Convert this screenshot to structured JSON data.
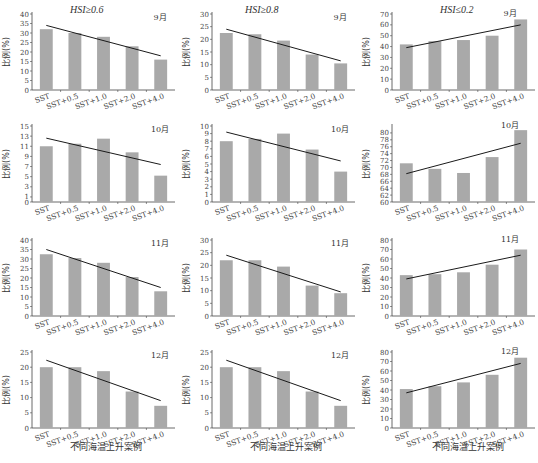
{
  "column_titles": [
    "HSI≥0.6",
    "HSI≥0.8",
    "HSI≤0.2"
  ],
  "x_axis_label": "不同海温上升案例",
  "y_axis_label": "比例(%)",
  "colors": {
    "bar": "#a9a9a9",
    "trend": "#1a1a1a",
    "axis": "#444444"
  },
  "chart_data": [
    {
      "type": "bar",
      "title": "HSI≥0.6",
      "month": "9月",
      "categories": [
        "SST",
        "SST+0.5",
        "SST+1.0",
        "SST+2.0",
        "SST+4.0"
      ],
      "values": [
        32,
        30,
        28,
        23,
        16
      ],
      "trend": [
        34,
        18
      ],
      "ylabel": "比例(%)",
      "ylim": [
        0,
        40
      ],
      "yticks": [
        0,
        5,
        10,
        15,
        20,
        25,
        30,
        35,
        40
      ]
    },
    {
      "type": "bar",
      "title": "HSI≥0.8",
      "month": "9月",
      "categories": [
        "SST",
        "SST+0.5",
        "SST+1.0",
        "SST+2.0",
        "SST+4.0"
      ],
      "values": [
        22.5,
        22,
        19.5,
        14,
        10.5
      ],
      "trend": [
        24,
        11.5
      ],
      "ylabel": "比例(%)",
      "ylim": [
        0,
        30
      ],
      "yticks": [
        0,
        5,
        10,
        15,
        20,
        25,
        30
      ]
    },
    {
      "type": "bar",
      "title": "HSI≤0.2",
      "month": "9月",
      "categories": [
        "SST",
        "SST+0.5",
        "SST+1.0",
        "SST+2.0",
        "SST+4.0"
      ],
      "values": [
        42,
        45,
        46,
        50,
        65
      ],
      "trend": [
        39,
        60
      ],
      "ylabel": "比例(%)",
      "ylim": [
        0,
        70
      ],
      "yticks": [
        0,
        10,
        20,
        30,
        40,
        50,
        60,
        70
      ]
    },
    {
      "type": "bar",
      "title": "HSI≥0.6",
      "month": "10月",
      "categories": [
        "SST",
        "SST+0.5",
        "SST+1.0",
        "SST+2.0",
        "SST+4.0"
      ],
      "values": [
        11,
        11.5,
        12.5,
        9.8,
        5.2
      ],
      "trend": [
        12.6,
        7.4
      ],
      "ylabel": "比例(%)",
      "ylim": [
        0,
        15
      ],
      "yticks": [
        0,
        1,
        3,
        5,
        7,
        9,
        11,
        13,
        15
      ]
    },
    {
      "type": "bar",
      "title": "HSI≥0.8",
      "month": "10月",
      "categories": [
        "SST",
        "SST+0.5",
        "SST+1.0",
        "SST+2.0",
        "SST+4.0"
      ],
      "values": [
        8,
        8.3,
        9,
        6.9,
        4
      ],
      "trend": [
        9.2,
        5.4
      ],
      "ylabel": "比例(%)",
      "ylim": [
        0,
        10
      ],
      "yticks": [
        0,
        1,
        2,
        3,
        4,
        5,
        6,
        7,
        8,
        9,
        10
      ]
    },
    {
      "type": "bar",
      "title": "HSI≤0.2",
      "month": "10月",
      "categories": [
        "SST",
        "SST+0.5",
        "SST+1.0",
        "SST+2.0",
        "SST+4.0"
      ],
      "values": [
        71.2,
        69.6,
        68.4,
        73,
        80.8
      ],
      "trend": [
        68.2,
        77
      ],
      "ylabel": "比例(%)",
      "ylim": [
        60,
        82
      ],
      "yticks": [
        60,
        62,
        64,
        66,
        68,
        70,
        72,
        74,
        76,
        78,
        80
      ]
    },
    {
      "type": "bar",
      "title": "HSI≥0.6",
      "month": "11月",
      "categories": [
        "SST",
        "SST+0.5",
        "SST+1.0",
        "SST+2.0",
        "SST+4.0"
      ],
      "values": [
        32.5,
        30.5,
        28,
        20.5,
        13
      ],
      "trend": [
        35,
        15
      ],
      "ylabel": "比例(%)",
      "ylim": [
        0,
        40
      ],
      "yticks": [
        0,
        5,
        10,
        15,
        20,
        25,
        30,
        35,
        40
      ]
    },
    {
      "type": "bar",
      "title": "HSI≥0.8",
      "month": "11月",
      "categories": [
        "SST",
        "SST+0.5",
        "SST+1.0",
        "SST+2.0",
        "SST+4.0"
      ],
      "values": [
        22,
        22,
        19.5,
        12,
        9
      ],
      "trend": [
        24,
        9.5
      ],
      "ylabel": "比例(%)",
      "ylim": [
        0,
        30
      ],
      "yticks": [
        0,
        5,
        10,
        15,
        20,
        25,
        30
      ]
    },
    {
      "type": "bar",
      "title": "HSI≤0.2",
      "month": "11月",
      "categories": [
        "SST",
        "SST+0.5",
        "SST+1.0",
        "SST+2.0",
        "SST+4.0"
      ],
      "values": [
        43,
        44,
        46,
        54,
        70
      ],
      "trend": [
        39,
        64
      ],
      "ylabel": "比例(%)",
      "ylim": [
        0,
        80
      ],
      "yticks": [
        0,
        10,
        20,
        30,
        40,
        50,
        60,
        70,
        80
      ]
    },
    {
      "type": "bar",
      "title": "HSI≥0.6",
      "month": "12月",
      "categories": [
        "SST",
        "SST+0.5",
        "SST+1.0",
        "SST+2.0",
        "SST+4.0"
      ],
      "values": [
        20,
        20,
        18.7,
        12,
        7.3
      ],
      "trend": [
        22.3,
        9
      ],
      "ylabel": "比例(%)",
      "ylim": [
        0,
        25
      ],
      "yticks": [
        0,
        5,
        10,
        15,
        20,
        25
      ]
    },
    {
      "type": "bar",
      "title": "HSI≥0.8",
      "month": "12月",
      "categories": [
        "SST",
        "SST+0.5",
        "SST+1.0",
        "SST+2.0",
        "SST+4.0"
      ],
      "values": [
        20,
        20,
        18.7,
        12,
        7.3
      ],
      "trend": [
        22.3,
        9
      ],
      "ylabel": "比例(%)",
      "ylim": [
        0,
        25
      ],
      "yticks": [
        0,
        5,
        10,
        15,
        20,
        25
      ]
    },
    {
      "type": "bar",
      "title": "HSI≤0.2",
      "month": "12月",
      "categories": [
        "SST",
        "SST+0.5",
        "SST+1.0",
        "SST+2.0",
        "SST+4.0"
      ],
      "values": [
        41,
        44,
        48,
        56,
        74
      ],
      "trend": [
        37,
        68
      ],
      "ylabel": "比例(%)",
      "ylim": [
        0,
        80
      ],
      "yticks": [
        0,
        10,
        20,
        30,
        40,
        50,
        60,
        70,
        80
      ]
    }
  ]
}
